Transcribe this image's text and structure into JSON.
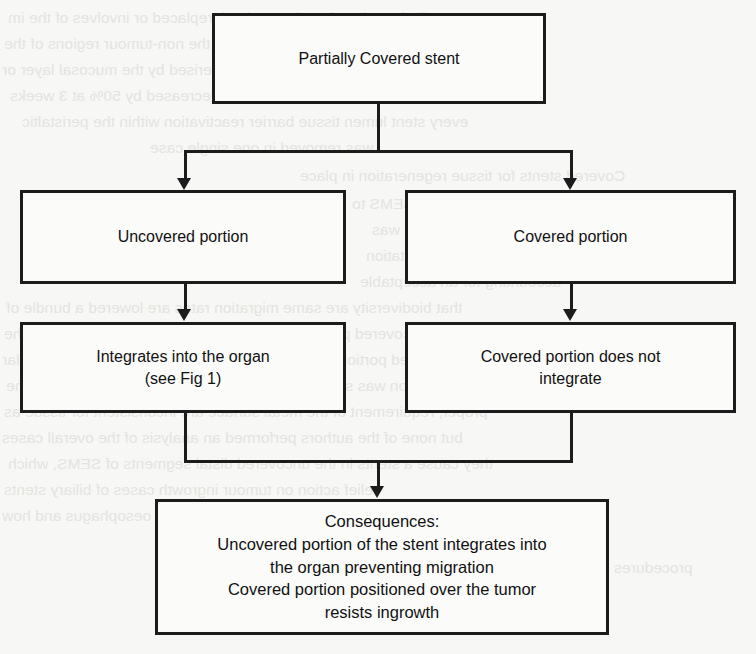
{
  "figure": {
    "type": "flowchart",
    "orientation": "top-down",
    "background_color": "#f7f7f5",
    "line_color": "#1c1c1c",
    "text_color": "#111111"
  },
  "nodes": {
    "root": {
      "id": "partially-covered-stent",
      "label": "Partially Covered stent"
    },
    "uncovered": {
      "id": "uncovered-portion",
      "label": "Uncovered portion"
    },
    "covered": {
      "id": "covered-portion",
      "label": "Covered portion"
    },
    "integrates": {
      "id": "integrates-into-organ",
      "label": "Integrates into the organ\n(see Fig 1)"
    },
    "not_integrates": {
      "id": "covered-portion-does-not-integrate",
      "label": "Covered portion does not\nintegrate"
    },
    "consequences": {
      "id": "consequences",
      "label": "Consequences:\nUncovered portion of the stent integrates into\nthe organ preventing migration\nCovered portion positioned over the tumor\nresists ingrowth"
    }
  },
  "edges": [
    {
      "from": "partially-covered-stent",
      "to": "uncovered-portion",
      "style": "elbow-arrow"
    },
    {
      "from": "partially-covered-stent",
      "to": "covered-portion",
      "style": "elbow-arrow"
    },
    {
      "from": "uncovered-portion",
      "to": "integrates-into-organ",
      "style": "straight-arrow"
    },
    {
      "from": "covered-portion",
      "to": "covered-portion-does-not-integrate",
      "style": "straight-arrow"
    },
    {
      "from": "integrates-into-organ",
      "to": "consequences",
      "style": "merge-arrow"
    },
    {
      "from": "covered-portion-does-not-integrate",
      "to": "consequences",
      "style": "merge-arrow"
    }
  ],
  "background_showthrough": {
    "note": "faint mirrored text bleeding through from the reverse side of the scanned page",
    "lines": [
      "palliative. Therefore the portion it replaced or involves of the im",
      "ones, which is necessary to accommodate for the non-tumour regions of the",
      "the left and more variable portion characterised by the mucosal layer or",
      "the margin exterior of the stent are decreased by 50% at 3 weeks",
      "every stent lumen tissue barrier reactivation within the peristaltic",
      "was removed in one single case",
      "Covered stents for tissue regeneration in place",
      "a combined covered architecture SEMS to",
      "The biliary outcome was",
      "a segmental dilatation",
      "accounting for an acceptable",
      "that biodiversity are same migration rates are lowered a bundle of",
      "a covered portion, the stent migration rate was low on all the",
      "covered portion of the barrier separated and subsequent tubular",
      "the invention was significantly higher in the uncovered form than the",
      "proper, requirement of the metal surface are inconsistent for tissue as",
      "but none of the authors performed an analysis of the overall cases",
      "they cause a stents in the uncovered distal segments of SEMS, which",
      "relief action on tumour ingrowth cases of biliary stents",
      "to have a malignant obstruction of the oesophagus and how",
      "procedures"
    ]
  }
}
